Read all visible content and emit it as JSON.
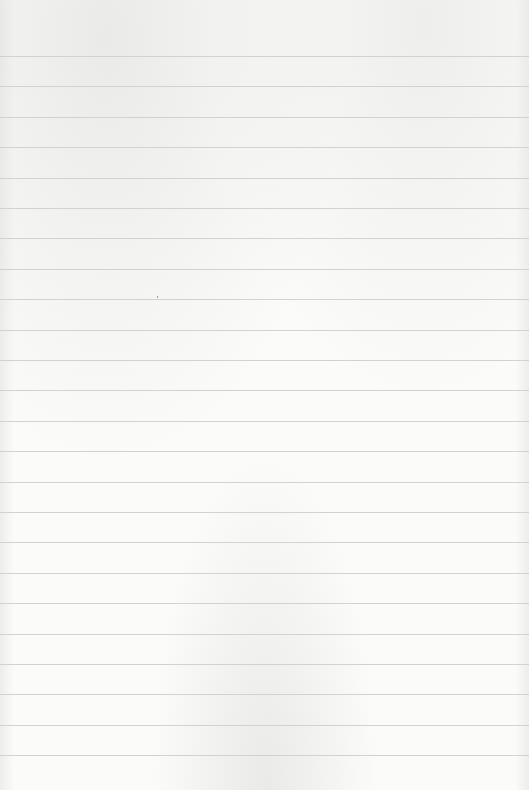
{
  "page": {
    "type": "lined-paper",
    "background_color": "#fbfbfa",
    "rule_color": "#d2d2d2",
    "first_rule_y": 56,
    "rule_spacing": 30.4,
    "rule_count": 24
  }
}
